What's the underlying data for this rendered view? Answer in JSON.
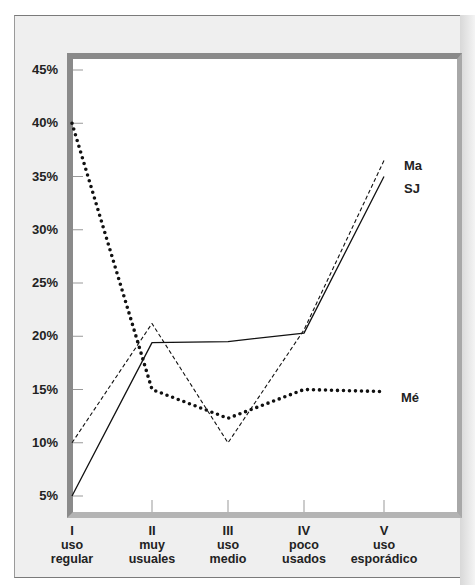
{
  "chart_data": {
    "type": "line",
    "title": "",
    "xlabel": "",
    "ylabel": "",
    "categories": [
      {
        "numeral": "I",
        "line1": "uso",
        "line2": "regular"
      },
      {
        "numeral": "II",
        "line1": "muy",
        "line2": "usuales"
      },
      {
        "numeral": "III",
        "line1": "uso",
        "line2": "medio"
      },
      {
        "numeral": "IV",
        "line1": "poco",
        "line2": "usados"
      },
      {
        "numeral": "V",
        "line1": "uso",
        "line2": "esporádico"
      }
    ],
    "yticks": [
      "45%",
      "40%",
      "35%",
      "30%",
      "25%",
      "20%",
      "15%",
      "10%",
      "5%"
    ],
    "ytick_values": [
      45,
      40,
      35,
      30,
      25,
      20,
      15,
      10,
      5
    ],
    "ylim": [
      3.5,
      46.5
    ],
    "grid": false,
    "legend_position": "inline-right",
    "series": [
      {
        "name": "Ma",
        "style": "dashed",
        "values": [
          10,
          21.2,
          10,
          20.6,
          36.5
        ]
      },
      {
        "name": "SJ",
        "style": "solid",
        "values": [
          5,
          19.4,
          19.5,
          20.3,
          35
        ]
      },
      {
        "name": "Mé",
        "style": "dotted",
        "values": [
          40,
          15,
          12.3,
          15,
          14.8
        ]
      }
    ]
  },
  "colors": {
    "frame_bg": "#efefef",
    "plot_border": "#8a8a8a",
    "line": "#111111"
  }
}
